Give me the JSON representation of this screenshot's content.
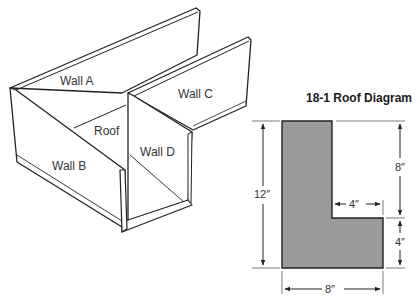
{
  "model": {
    "walls": {
      "a": "Wall A",
      "b": "Wall B",
      "c": "Wall C",
      "d": "Wall D"
    },
    "roof": "Roof"
  },
  "roof_diagram": {
    "title": "18-1 Roof Diagram",
    "fill_color": "#9a9a9a",
    "dimensions": {
      "total_height": "12″",
      "upper_height": "8″",
      "lower_height": "4″",
      "notch_width": "4″",
      "total_width": "8″"
    }
  }
}
